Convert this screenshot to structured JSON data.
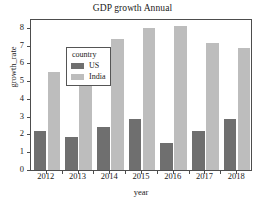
{
  "chart_data": {
    "type": "bar",
    "title": "GDP growth Annual",
    "xlabel": "year",
    "ylabel": "growth_rate",
    "categories": [
      "2012",
      "2013",
      "2014",
      "2015",
      "2016",
      "2017",
      "2018"
    ],
    "series": [
      {
        "name": "US",
        "color": "#6f6f6f",
        "values": [
          2.2,
          1.85,
          2.45,
          2.9,
          1.55,
          2.2,
          2.85
        ]
      },
      {
        "name": "India",
        "color": "#bdbdbd",
        "values": [
          5.5,
          6.35,
          7.4,
          8.0,
          8.1,
          7.15,
          6.9
        ]
      }
    ],
    "ylim": [
      0,
      8.45
    ],
    "yticks": [
      0,
      1,
      2,
      3,
      4,
      5,
      6,
      7,
      8
    ],
    "ytick_labels": [
      "0",
      "1",
      "2",
      "3",
      "4",
      "5",
      "6",
      "7",
      "8"
    ],
    "grid": false,
    "legend": {
      "title": "country",
      "position": "upper-left",
      "entries": [
        "US",
        "India"
      ]
    }
  }
}
